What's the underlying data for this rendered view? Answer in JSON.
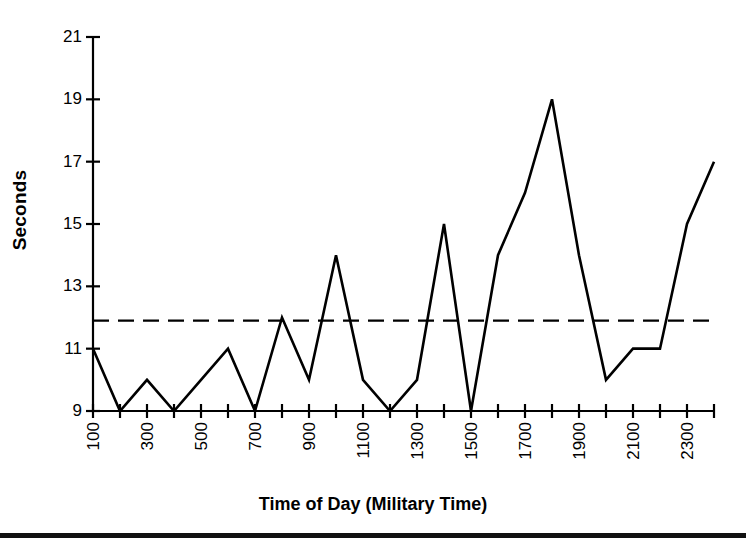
{
  "chart_data": {
    "type": "line",
    "title": "",
    "xlabel": "Time of Day (Military Time)",
    "ylabel": "Seconds",
    "x": [
      100,
      200,
      300,
      400,
      500,
      600,
      700,
      800,
      900,
      1000,
      1100,
      1200,
      1300,
      1400,
      1500,
      1600,
      1700,
      1800,
      1900,
      2000,
      2100,
      2200,
      2300,
      2400
    ],
    "values": [
      11,
      9,
      10,
      9,
      10,
      11,
      9,
      12,
      10,
      14,
      10,
      9,
      10,
      15,
      9,
      14,
      16,
      19,
      14,
      10,
      11,
      11,
      15,
      17
    ],
    "series": [
      {
        "name": "Seconds",
        "values": [
          11,
          9,
          10,
          9,
          10,
          11,
          9,
          12,
          10,
          14,
          10,
          9,
          10,
          15,
          9,
          14,
          16,
          19,
          14,
          10,
          11,
          11,
          15,
          17
        ],
        "style": "solid",
        "color": "#000000"
      }
    ],
    "reference_line": {
      "name": "mean",
      "value": 11.9,
      "style": "dashed",
      "color": "#000000"
    },
    "xlim": [
      100,
      2400
    ],
    "ylim": [
      9,
      21
    ],
    "ytick_values": [
      9,
      11,
      13,
      15,
      17,
      19,
      21
    ],
    "ytick_labels": [
      "9",
      "11",
      "13",
      "15",
      "17",
      "19",
      "21"
    ],
    "xtick_values": [
      100,
      200,
      300,
      400,
      500,
      600,
      700,
      800,
      900,
      1000,
      1100,
      1200,
      1300,
      1400,
      1500,
      1600,
      1700,
      1800,
      1900,
      2000,
      2100,
      2200,
      2300,
      2400
    ],
    "xtick_labels": [
      "100",
      "",
      "300",
      "",
      "500",
      "",
      "700",
      "",
      "900",
      "",
      "1100",
      "",
      "1300",
      "",
      "1500",
      "",
      "1700",
      "",
      "1900",
      "",
      "2100",
      "",
      "2300",
      ""
    ],
    "xtick_label_rotation": 90,
    "grid": false,
    "legend": "none"
  },
  "axes": {
    "y_title": "Seconds",
    "x_title": "Time of Day (Military Time)"
  },
  "colors": {
    "line": "#000000",
    "axis": "#000000",
    "reference": "#000000",
    "background": "#ffffff"
  }
}
